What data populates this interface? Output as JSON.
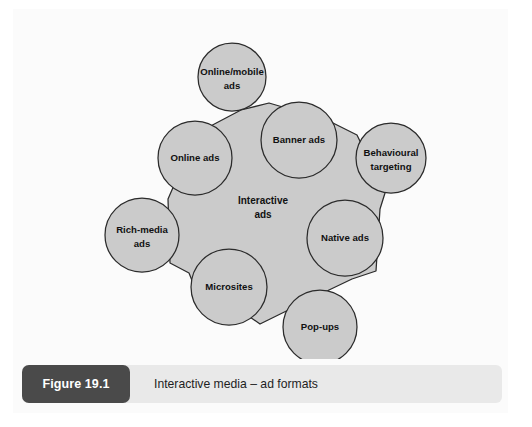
{
  "figure": {
    "badge_label": "Figure 19.1",
    "caption": "Interactive media – ad formats"
  },
  "colors": {
    "node_fill": "#cbcbcb",
    "node_stroke": "#2b2b2b",
    "card_background": "#fbfbfb",
    "caption_bar": "#e9e9e9",
    "badge_background": "#4a4a4a",
    "badge_text": "#ffffff",
    "label_text": "#111111"
  },
  "diagram": {
    "type": "hub-and-satellite cluster",
    "center": {
      "label_line1": "Interactive",
      "label_line2": "ads",
      "cx": 250,
      "cy": 197
    },
    "nodes": [
      {
        "id": "online-mobile-ads",
        "label_line1": "Online/mobile",
        "label_line2": "ads",
        "cx": 219,
        "cy": 68,
        "r": 34
      },
      {
        "id": "banner-ads",
        "label_line1": "Banner ads",
        "label_line2": "",
        "cx": 286,
        "cy": 131,
        "r": 38
      },
      {
        "id": "behavioural-targeting",
        "label_line1": "Behavioural",
        "label_line2": "targeting",
        "cx": 378,
        "cy": 149,
        "r": 35
      },
      {
        "id": "native-ads",
        "label_line1": "Native ads",
        "label_line2": "",
        "cx": 332,
        "cy": 229,
        "r": 38
      },
      {
        "id": "pop-ups",
        "label_line1": "Pop-ups",
        "label_line2": "",
        "cx": 307,
        "cy": 318,
        "r": 37
      },
      {
        "id": "microsites",
        "label_line1": "Microsites",
        "label_line2": "",
        "cx": 216,
        "cy": 278,
        "r": 38
      },
      {
        "id": "rich-media-ads",
        "label_line1": "Rich-media",
        "label_line2": "ads",
        "cx": 129,
        "cy": 226,
        "r": 37
      },
      {
        "id": "online-ads",
        "label_line1": "Online ads",
        "label_line2": "",
        "cx": 182,
        "cy": 149,
        "r": 37
      }
    ],
    "blob_path": "M 228 101 L 256 94 L 314 111 L 344 126 L 372 184 L 367 200 L 363 262 L 339 270 L 316 281 L 247 315 L 234 306 L 184 284 L 176 264 L 157 254 L 155 190 L 162 174 L 165 132 L 190 121 Z"
  }
}
